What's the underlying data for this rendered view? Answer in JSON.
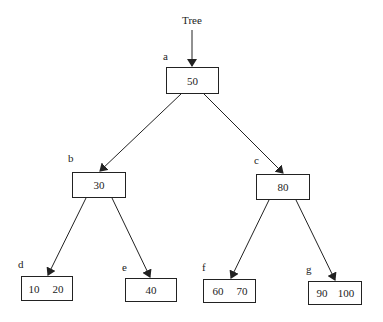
{
  "root_pointer": {
    "label": "Tree"
  },
  "nodes": [
    {
      "id": "a",
      "label": "a",
      "keys": [
        "50"
      ]
    },
    {
      "id": "b",
      "label": "b",
      "keys": [
        "30"
      ]
    },
    {
      "id": "c",
      "label": "c",
      "keys": [
        "80"
      ]
    },
    {
      "id": "d",
      "label": "d",
      "keys": [
        "10",
        "20"
      ]
    },
    {
      "id": "e",
      "label": "e",
      "keys": [
        "40"
      ]
    },
    {
      "id": "f",
      "label": "f",
      "keys": [
        "60",
        "70"
      ]
    },
    {
      "id": "g",
      "label": "g",
      "keys": [
        "90",
        "100"
      ]
    }
  ],
  "edges": [
    {
      "from": "a",
      "to": "b"
    },
    {
      "from": "a",
      "to": "c"
    },
    {
      "from": "b",
      "to": "d"
    },
    {
      "from": "b",
      "to": "e"
    },
    {
      "from": "c",
      "to": "f"
    },
    {
      "from": "c",
      "to": "g"
    }
  ]
}
